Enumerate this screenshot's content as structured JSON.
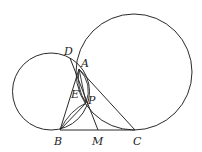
{
  "diagram": {
    "type": "geometry",
    "circles": [
      {
        "name": "left-circle",
        "cx": 51,
        "cy": 91.5,
        "r": 38.5
      },
      {
        "name": "right-circle",
        "cx": 134,
        "cy": 72,
        "r": 58
      }
    ],
    "points": {
      "A": {
        "x": 79,
        "y": 69
      },
      "B": {
        "x": 60,
        "y": 130
      },
      "C": {
        "x": 135,
        "y": 130
      },
      "D": {
        "x": 70,
        "y": 58
      },
      "E": {
        "x": 78,
        "y": 84
      },
      "M": {
        "x": 98,
        "y": 130
      },
      "P": {
        "x": 86,
        "y": 103
      }
    },
    "labels": {
      "A": "A",
      "B": "B",
      "C": "C",
      "D": "D",
      "E": "E",
      "M": "M",
      "P": "P"
    },
    "segments": [
      [
        "B",
        "C"
      ],
      [
        "B",
        "A"
      ],
      [
        "A",
        "C"
      ],
      [
        "D",
        "M"
      ],
      [
        "B",
        "P"
      ],
      [
        "A",
        "P"
      ]
    ]
  }
}
